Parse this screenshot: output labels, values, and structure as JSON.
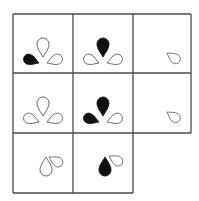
{
  "puzzle": {
    "description": "3x3 matrix reasoning puzzle with missing bottom-right cell",
    "line_color": "#4a4a4a",
    "fill_color": "#111111",
    "outline_color": "#555555",
    "grid": {
      "cols_x": [
        13,
        73,
        133,
        191
      ],
      "rows_y": [
        14,
        73,
        133,
        193
      ]
    },
    "cells": [
      {
        "row": 1,
        "col": 1,
        "shapes": [
          {
            "name": "drop-top",
            "fill": "outline"
          },
          {
            "name": "drop-left",
            "fill": "filled"
          },
          {
            "name": "drop-right",
            "fill": "outline"
          }
        ]
      },
      {
        "row": 1,
        "col": 2,
        "shapes": [
          {
            "name": "drop-top",
            "fill": "filled"
          },
          {
            "name": "drop-left",
            "fill": "outline"
          },
          {
            "name": "drop-right",
            "fill": "outline"
          }
        ]
      },
      {
        "row": 1,
        "col": 3,
        "shapes": [
          {
            "name": "drop-single",
            "fill": "outline"
          }
        ]
      },
      {
        "row": 2,
        "col": 1,
        "shapes": [
          {
            "name": "drop-top",
            "fill": "outline"
          },
          {
            "name": "drop-left",
            "fill": "outline"
          },
          {
            "name": "drop-right",
            "fill": "outline"
          }
        ]
      },
      {
        "row": 2,
        "col": 2,
        "shapes": [
          {
            "name": "drop-top",
            "fill": "filled"
          },
          {
            "name": "drop-left",
            "fill": "filled"
          },
          {
            "name": "drop-right",
            "fill": "outline"
          }
        ]
      },
      {
        "row": 2,
        "col": 3,
        "shapes": [
          {
            "name": "drop-single",
            "fill": "outline"
          }
        ]
      },
      {
        "row": 3,
        "col": 1,
        "shapes": [
          {
            "name": "drop-up",
            "fill": "outline"
          },
          {
            "name": "drop-side",
            "fill": "outline"
          }
        ]
      },
      {
        "row": 3,
        "col": 2,
        "shapes": [
          {
            "name": "drop-up",
            "fill": "filled"
          },
          {
            "name": "drop-side",
            "fill": "outline"
          }
        ]
      },
      {
        "row": 3,
        "col": 3,
        "shapes": [],
        "missing": true
      }
    ]
  }
}
